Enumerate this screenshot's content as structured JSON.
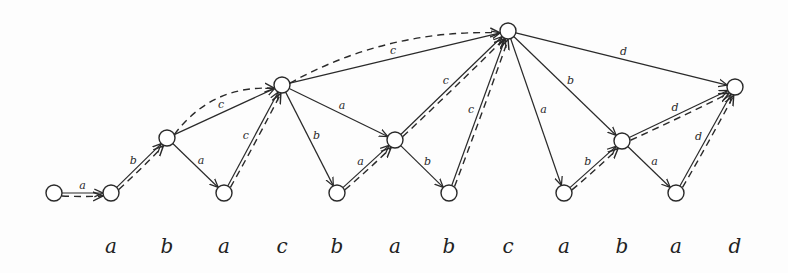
{
  "diagram": {
    "type": "automaton",
    "string": [
      "a",
      "b",
      "a",
      "c",
      "b",
      "a",
      "b",
      "c",
      "a",
      "b",
      "a",
      "d"
    ],
    "colors": {
      "stroke": "#2a2a2a",
      "background": "#fdfdfd"
    },
    "nodes": [
      {
        "id": 0,
        "x": 54,
        "y": 193
      },
      {
        "id": 1,
        "x": 111,
        "y": 193
      },
      {
        "id": 2,
        "x": 167,
        "y": 138
      },
      {
        "id": 3,
        "x": 224,
        "y": 193
      },
      {
        "id": 4,
        "x": 282,
        "y": 85
      },
      {
        "id": 5,
        "x": 337,
        "y": 193
      },
      {
        "id": 6,
        "x": 395,
        "y": 140
      },
      {
        "id": 7,
        "x": 449,
        "y": 193
      },
      {
        "id": 8,
        "x": 508,
        "y": 31
      },
      {
        "id": 9,
        "x": 564,
        "y": 193
      },
      {
        "id": 10,
        "x": 622,
        "y": 141
      },
      {
        "id": 11,
        "x": 676,
        "y": 193
      },
      {
        "id": 12,
        "x": 735,
        "y": 87
      }
    ],
    "solid_edges": [
      {
        "from": 0,
        "to": 1,
        "label": "a"
      },
      {
        "from": 1,
        "to": 2,
        "label": "b"
      },
      {
        "from": 2,
        "to": 3,
        "label": "a"
      },
      {
        "from": 2,
        "to": 4,
        "label": "c"
      },
      {
        "from": 3,
        "to": 4,
        "label": "c"
      },
      {
        "from": 4,
        "to": 5,
        "label": "b"
      },
      {
        "from": 4,
        "to": 6,
        "label": "a"
      },
      {
        "from": 5,
        "to": 6,
        "label": "a"
      },
      {
        "from": 4,
        "to": 8,
        "label": "c"
      },
      {
        "from": 6,
        "to": 7,
        "label": "b"
      },
      {
        "from": 6,
        "to": 8,
        "label": "c"
      },
      {
        "from": 7,
        "to": 8,
        "label": "c"
      },
      {
        "from": 8,
        "to": 9,
        "label": "a"
      },
      {
        "from": 8,
        "to": 10,
        "label": "b"
      },
      {
        "from": 9,
        "to": 10,
        "label": "b"
      },
      {
        "from": 10,
        "to": 11,
        "label": "a"
      },
      {
        "from": 8,
        "to": 12,
        "label": "d"
      },
      {
        "from": 10,
        "to": 12,
        "label": "d"
      },
      {
        "from": 11,
        "to": 12,
        "label": "d"
      }
    ],
    "dashed_edges": [
      {
        "from": 0,
        "to": 1,
        "curve": 0
      },
      {
        "from": 1,
        "to": 2,
        "curve": 0
      },
      {
        "from": 2,
        "to": 4,
        "curve": -30
      },
      {
        "from": 3,
        "to": 4,
        "curve": 0
      },
      {
        "from": 5,
        "to": 6,
        "curve": 0
      },
      {
        "from": 4,
        "to": 8,
        "curve": -30
      },
      {
        "from": 6,
        "to": 8,
        "curve": 0
      },
      {
        "from": 7,
        "to": 8,
        "curve": 0
      },
      {
        "from": 9,
        "to": 10,
        "curve": 0
      },
      {
        "from": 10,
        "to": 12,
        "curve": 0
      },
      {
        "from": 11,
        "to": 12,
        "curve": 0
      }
    ],
    "bottom_labels": [
      {
        "text": "a",
        "x": 111
      },
      {
        "text": "b",
        "x": 167
      },
      {
        "text": "a",
        "x": 224
      },
      {
        "text": "c",
        "x": 282
      },
      {
        "text": "b",
        "x": 337
      },
      {
        "text": "a",
        "x": 395
      },
      {
        "text": "b",
        "x": 449
      },
      {
        "text": "c",
        "x": 508
      },
      {
        "text": "a",
        "x": 564
      },
      {
        "text": "b",
        "x": 622
      },
      {
        "text": "a",
        "x": 676
      },
      {
        "text": "d",
        "x": 735
      }
    ]
  }
}
